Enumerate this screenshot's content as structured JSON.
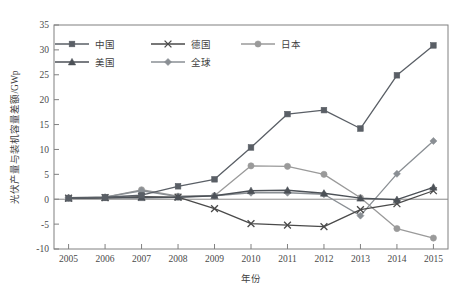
{
  "chart_data": {
    "type": "line",
    "title": "",
    "xlabel": "年份",
    "ylabel": "光伏产量与装机容量差额/GWp",
    "x": [
      2005,
      2006,
      2007,
      2008,
      2009,
      2010,
      2011,
      2012,
      2013,
      2014,
      2015
    ],
    "categories": [
      "2005",
      "2006",
      "2007",
      "2008",
      "2009",
      "2010",
      "2011",
      "2012",
      "2013",
      "2014",
      "2015"
    ],
    "xlim": [
      2004.6,
      2015.4
    ],
    "ylim": [
      -10,
      35
    ],
    "yticks": [
      -10,
      -5,
      0,
      5,
      10,
      15,
      20,
      25,
      30,
      35
    ],
    "ytick_labels": [
      "-10",
      "-5",
      "0",
      "5",
      "10",
      "15",
      "20",
      "25",
      "30",
      "35"
    ],
    "grid": false,
    "legend_position": "upper-left-inside",
    "series": [
      {
        "name": "中国",
        "marker": "square",
        "color": "#5a5f66",
        "values": [
          0.2,
          0.4,
          0.8,
          2.6,
          4.0,
          10.4,
          17.1,
          17.9,
          14.2,
          24.9,
          30.9
        ]
      },
      {
        "name": "德国",
        "marker": "x",
        "color": "#4a4a4a",
        "values": [
          0.2,
          0.3,
          0.5,
          0.4,
          -1.9,
          -4.9,
          -5.2,
          -5.5,
          -2.1,
          -0.9,
          1.7
        ]
      },
      {
        "name": "日本",
        "marker": "circle",
        "color": "#9a9a9a",
        "values": [
          0.3,
          0.4,
          1.9,
          0.6,
          0.7,
          6.7,
          6.6,
          5.0,
          0.3,
          -5.9,
          -7.8
        ]
      },
      {
        "name": "美国",
        "marker": "triangle",
        "color": "#4c5157",
        "values": [
          0.2,
          0.3,
          0.3,
          0.4,
          0.7,
          1.7,
          1.8,
          1.2,
          0.2,
          -0.1,
          2.4
        ]
      },
      {
        "name": "全球",
        "marker": "diamond",
        "color": "#8a8f94",
        "values": [
          0.3,
          0.4,
          1.7,
          0.5,
          0.7,
          1.3,
          1.3,
          1.0,
          -3.3,
          5.1,
          11.7
        ]
      }
    ]
  }
}
